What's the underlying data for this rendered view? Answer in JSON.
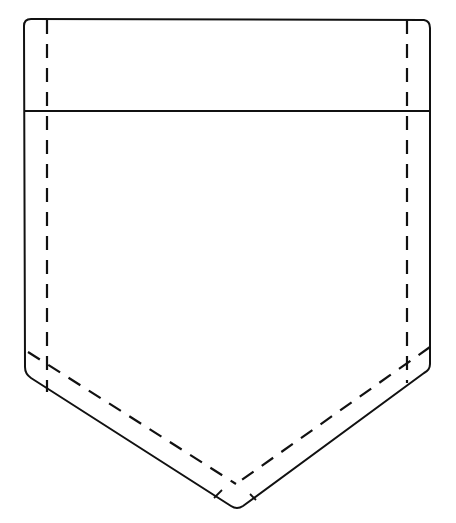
{
  "diagram": {
    "stroke_color": "#111111",
    "background": "#ffffff",
    "parts": [
      {
        "id": "outer-outline",
        "style": "solid"
      },
      {
        "id": "flap-fold-line",
        "style": "solid"
      },
      {
        "id": "left-stitch-line",
        "style": "dashed"
      },
      {
        "id": "right-stitch-line",
        "style": "dashed"
      },
      {
        "id": "bottom-left-stitch-line",
        "style": "dashed"
      },
      {
        "id": "bottom-right-stitch-line",
        "style": "dashed"
      }
    ]
  }
}
